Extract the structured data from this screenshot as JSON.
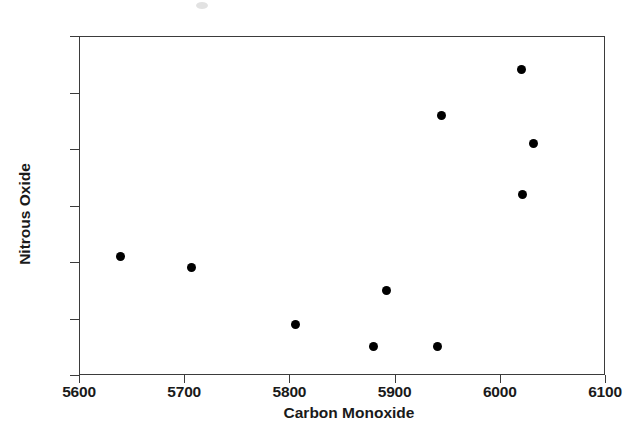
{
  "chart_data": {
    "type": "scatter",
    "title": "",
    "xlabel": "Carbon Monoxide",
    "ylabel": "Nitrous Oxide",
    "xlim": [
      5600,
      6100
    ],
    "ylim": [
      330,
      390
    ],
    "xticks": [
      5600,
      5700,
      5800,
      5900,
      6000,
      6100
    ],
    "yticks": [
      330,
      340,
      350,
      360,
      370,
      380,
      390
    ],
    "xtick_labels": [
      "5600",
      "5700",
      "5800",
      "5900",
      "6000",
      "6100"
    ],
    "ytick_labels": [
      "330",
      "340",
      "350",
      "360",
      "370",
      "380",
      "390"
    ],
    "grid": false,
    "legend": "none",
    "marker": "filled-circle",
    "marker_color": "#000000",
    "frame_color": "#3b3b3b",
    "points": [
      {
        "x": 5639,
        "y": 351
      },
      {
        "x": 5707,
        "y": 349
      },
      {
        "x": 5806,
        "y": 339
      },
      {
        "x": 5880,
        "y": 335
      },
      {
        "x": 5892,
        "y": 345
      },
      {
        "x": 5941,
        "y": 335
      },
      {
        "x": 5945,
        "y": 376
      },
      {
        "x": 6021,
        "y": 384
      },
      {
        "x": 6022,
        "y": 362
      },
      {
        "x": 6032,
        "y": 371
      }
    ]
  }
}
